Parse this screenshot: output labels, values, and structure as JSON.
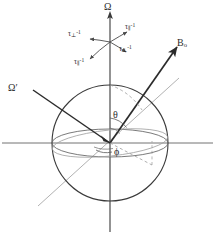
{
  "figure": {
    "type": "vector-sphere-diagram",
    "width": 216,
    "height": 239,
    "background": "#ffffff"
  },
  "colors": {
    "line_dark": "#2b2b2b",
    "line_gray": "#8c8c8c",
    "line_light_gray": "#a8a8a8",
    "text": "#2b2b2b",
    "background": "#ffffff"
  },
  "labels": {
    "omega": "Ω",
    "omega_prime": "Ω′",
    "b_field": "B",
    "b_field_sub": "o",
    "theta": "θ",
    "phi": "ϕ",
    "tau_perp_1": "τ",
    "tau_perp_sub": "⊥",
    "tau_par_sub": "∥",
    "tau_sup": "-1"
  },
  "relaxation_arrows": [
    {
      "id": "tau-perp-upper-right",
      "symbol": "τ",
      "subscript": "∥",
      "superscript": "-1",
      "x": 121,
      "y": 27
    },
    {
      "id": "tau-perp-upper-left",
      "symbol": "τ",
      "subscript": "⊥",
      "superscript": "-1",
      "x": 70,
      "y": 34
    },
    {
      "id": "tau-par-lower-right",
      "symbol": "τ",
      "subscript": "⊥",
      "superscript": "-1",
      "x": 118,
      "y": 47
    },
    {
      "id": "tau-par-lower-left",
      "symbol": "τ",
      "subscript": "∥",
      "superscript": "-1",
      "x": 75,
      "y": 60
    }
  ],
  "vectors": [
    {
      "name": "omega-axis",
      "label": "Ω",
      "description": "vertical rotation axis, arrow up"
    },
    {
      "name": "omega-prime",
      "label": "Ω′",
      "description": "tilted axis toward upper-left"
    },
    {
      "name": "b0-field",
      "label": "Bo",
      "description": "magnetic field vector toward upper-right"
    }
  ],
  "angles": [
    {
      "name": "theta",
      "label": "θ",
      "description": "polar angle between omega axis and B0"
    },
    {
      "name": "phi",
      "label": "ϕ",
      "description": "azimuthal angle in the equatorial plane"
    }
  ]
}
